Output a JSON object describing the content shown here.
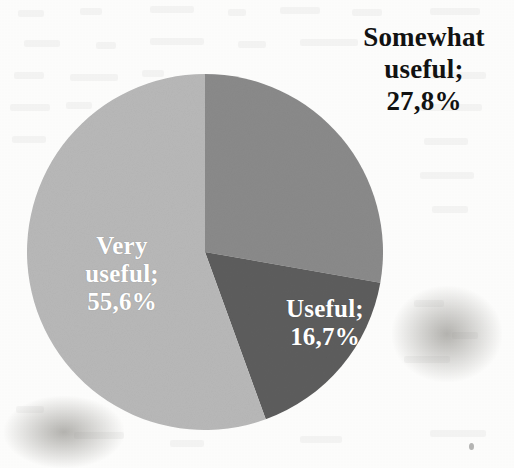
{
  "chart_data": {
    "type": "pie",
    "title": "",
    "subtitle": "",
    "xlabel": "",
    "ylabel": "",
    "legend_position": "none",
    "grid": false,
    "value_suffix": "%",
    "decimal_separator": ",",
    "total": 100.1,
    "start_angle_deg": 0,
    "direction": "clockwise",
    "categories": [
      "Somewhat useful",
      "Useful",
      "Very useful"
    ],
    "values": [
      27.8,
      16.7,
      55.6
    ],
    "value_labels": [
      "27,8%",
      "16,7%",
      "55,6%"
    ],
    "colors": [
      "#8a8a8a",
      "#5d5d5d",
      "#b8b8b8"
    ],
    "slices": [
      {
        "name": "Somewhat useful",
        "label_text": "Somewhat\nuseful;\n27,8%",
        "category": "Somewhat useful",
        "value": 27.8,
        "value_label": "27,8%",
        "color": "#8a8a8a",
        "label_color": "#121212",
        "label_placement": "outside",
        "start_angle_deg": 0,
        "end_angle_deg": 100.1
      },
      {
        "name": "Useful",
        "label_text": "Useful;\n16,7%",
        "category": "Useful",
        "value": 16.7,
        "value_label": "16,7%",
        "color": "#5d5d5d",
        "label_color": "#ffffff",
        "label_placement": "inside",
        "start_angle_deg": 100.1,
        "end_angle_deg": 160.2
      },
      {
        "name": "Very useful",
        "label_text": "Very\nuseful;\n55,6%",
        "category": "Very useful",
        "value": 55.6,
        "value_label": "55,6%",
        "color": "#b8b8b8",
        "label_color": "#ffffff",
        "label_placement": "inside",
        "start_angle_deg": 160.2,
        "end_angle_deg": 360.0
      }
    ]
  },
  "figure": {
    "background_color": "#fcfcfb",
    "center_x": 205,
    "center_y": 252,
    "radius": 178
  }
}
